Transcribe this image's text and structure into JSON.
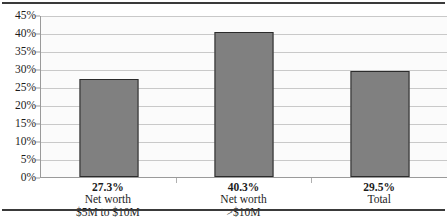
{
  "chart_data": {
    "type": "bar",
    "title": "",
    "xlabel": "",
    "ylabel": "",
    "categories": [
      "Net worth\n$5M to $10M",
      "Net worth\n>$10M",
      "Total"
    ],
    "category_lines": [
      [
        "Net worth",
        "$5M to $10M"
      ],
      [
        "Net worth",
        ">$10M"
      ],
      [
        "Total",
        ""
      ]
    ],
    "values": [
      27.3,
      40.3,
      29.5
    ],
    "data_labels": [
      "27.3%",
      "40.3%",
      "29.5%"
    ],
    "ylim": [
      0,
      45
    ],
    "ytick_values": [
      0,
      5,
      10,
      15,
      20,
      25,
      30,
      35,
      40,
      45
    ],
    "ytick_labels": [
      "0%",
      "5%",
      "10%",
      "15%",
      "20%",
      "25%",
      "30%",
      "35%",
      "40%",
      "45%"
    ],
    "grid": true,
    "legend": false,
    "legend_position": "none",
    "bar_color": "#808080",
    "bar_border_color": "#2b2b2b",
    "plot_background": "#fbfbfb",
    "gridline_color": "#c9c9c9",
    "axis_color": "#9a9a9a",
    "rule_color": "#3a3a3a",
    "text_color": "#1c1c1c"
  }
}
